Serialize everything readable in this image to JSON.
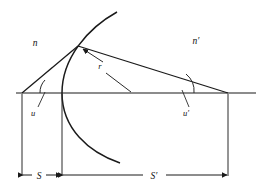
{
  "figure": {
    "kind": "optics-refraction-diagram",
    "background_color": "#ffffff",
    "ink_color": "#1a1a1a"
  },
  "labels": {
    "medium_left": "n",
    "medium_right": "n′",
    "angle_left": "u",
    "angle_right": "u′",
    "radius": "r",
    "distance_object": "S",
    "distance_image": "S′"
  },
  "geometry": {
    "axis": {
      "x1": 16,
      "y1": 93,
      "x2": 256,
      "y2": 93
    },
    "vertex": {
      "x": 62,
      "y": 93
    },
    "surface_point": {
      "x": 78,
      "y": 46
    },
    "object_point": {
      "x": 22,
      "y": 93
    },
    "image_point": {
      "x": 228,
      "y": 93
    },
    "center_of_curvature": {
      "x": 130,
      "y": 93
    },
    "dimension_line_y": 175,
    "arc": {
      "top_end": {
        "x": 117,
        "y": 12
      },
      "bottom_end": {
        "x": 120,
        "y": 163
      },
      "through": {
        "x": 62,
        "y": 93
      }
    }
  },
  "label_positions": {
    "medium_left": {
      "x": 35,
      "y": 46
    },
    "medium_right": {
      "x": 196,
      "y": 44
    },
    "angle_left": {
      "x": 33,
      "y": 113
    },
    "angle_right": {
      "x": 185,
      "y": 113
    },
    "radius": {
      "x": 100,
      "y": 68
    },
    "distance_object": {
      "x": 38,
      "y": 178
    },
    "distance_image": {
      "x": 152,
      "y": 178
    }
  },
  "leader_lines": {
    "angle_left": {
      "x1": 38,
      "y1": 107,
      "x2": 45,
      "y2": 93
    },
    "angle_right": {
      "x1": 189,
      "y1": 107,
      "x2": 181,
      "y2": 90
    },
    "radius_to_axis": {
      "x1": 105,
      "y1": 72,
      "x2": 130,
      "y2": 93
    },
    "radius_to_surface": {
      "x1": 103,
      "y1": 63,
      "x2": 81,
      "y2": 48
    }
  }
}
